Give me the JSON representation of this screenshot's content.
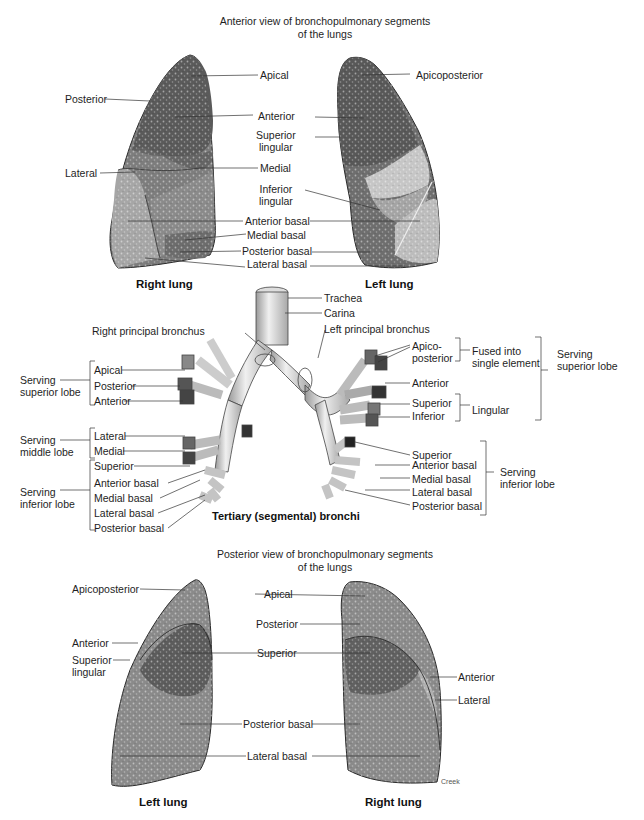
{
  "anterior_view": {
    "title": "Anterior view of bronchopulmonary segments\nof the lungs",
    "right_lung": {
      "caption": "Right lung",
      "labels": [
        "Apical",
        "Posterior",
        "Anterior",
        "Lateral",
        "Medial",
        "Medial basal",
        "Anterior basal",
        "Posterior basal",
        "Lateral basal"
      ]
    },
    "left_lung": {
      "caption": "Left lung",
      "labels": [
        "Apicoposterior",
        "Anterior",
        "Superior\nlingular",
        "Inferior\nlingular",
        "Anterior basal",
        "Medial basal",
        "Posterior basal",
        "Lateral basal"
      ]
    },
    "shared_labels": {
      "apical": "Apical",
      "posterior": "Posterior",
      "anterior": "Anterior",
      "superior_lingular": "Superior\nlingular",
      "lateral": "Lateral",
      "medial": "Medial",
      "inferior_lingular": "Inferior\nlingular",
      "anterior_basal": "Anterior basal",
      "medial_basal": "Medial basal",
      "posterior_basal": "Posterior basal",
      "lateral_basal": "Lateral basal",
      "apicoposterior": "Apicoposterior"
    }
  },
  "bronchi": {
    "caption": "Tertiary (segmental) bronchi",
    "trachea": "Trachea",
    "carina": "Carina",
    "right_principal": "Right principal bronchus",
    "left_principal": "Left principal bronchus",
    "right": {
      "superior_group": "Serving\nsuperior lobe",
      "superior_items": [
        "Apical",
        "Posterior",
        "Anterior"
      ],
      "middle_group": "Serving\nmiddle lobe",
      "middle_items": [
        "Lateral",
        "Medial"
      ],
      "inferior_group": "Serving\ninferior lobe",
      "inferior_items": [
        "Superior",
        "Anterior basal",
        "Medial basal",
        "Lateral basal",
        "Posterior basal"
      ]
    },
    "left": {
      "apicoposterior": "Apico-\nposterior",
      "fused": "Fused into\nsingle element",
      "anterior": "Anterior",
      "lingular_items": [
        "Superior",
        "Inferior"
      ],
      "lingular_group": "Lingular",
      "superior_group": "Serving\nsuperior lobe",
      "inferior_items": [
        "Superior",
        "Anterior basal",
        "Medial basal",
        "Lateral basal",
        "Posterior basal"
      ],
      "inferior_group": "Serving\ninferior lobe"
    }
  },
  "posterior_view": {
    "title": "Posterior view of bronchopulmonary segments\nof the lungs",
    "left_lung": {
      "caption": "Left lung",
      "labels": [
        "Apicoposterior",
        "Anterior",
        "Superior\nlingular"
      ]
    },
    "center_labels": [
      "Apical",
      "Posterior",
      "Superior",
      "Posterior basal",
      "Lateral basal"
    ],
    "right_lung": {
      "caption": "Right lung",
      "labels": [
        "Anterior",
        "Lateral"
      ]
    },
    "signature": "Creek"
  },
  "colors": {
    "dark_segment": "#5a5a5a",
    "mid_segment": "#8a8a8a",
    "light_segment": "#b8b8b8",
    "outline": "#2a2a2a",
    "leader_line": "#333333"
  }
}
